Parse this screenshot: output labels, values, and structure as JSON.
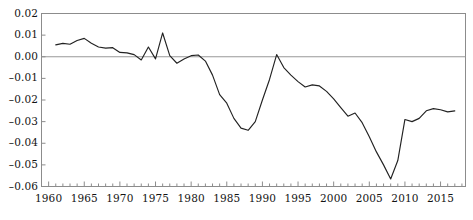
{
  "chart_data": {
    "type": "line",
    "title": "",
    "xlabel": "",
    "ylabel": "",
    "xlim": [
      1959.0,
      2018.5
    ],
    "ylim": [
      -0.06,
      0.02
    ],
    "grid": false,
    "legend": null,
    "zero_line": 0.0,
    "y_ticks": [
      0.02,
      0.01,
      0.0,
      -0.01,
      -0.02,
      -0.03,
      -0.04,
      -0.05,
      -0.06
    ],
    "y_tick_labels": [
      "0.02",
      "0.01",
      "0.00",
      "–0.01",
      "–0.02",
      "–0.03",
      "–0.04",
      "–0.05",
      "–0.06"
    ],
    "x_ticks": [
      1960,
      1965,
      1970,
      1975,
      1980,
      1985,
      1990,
      1995,
      2000,
      2005,
      2010,
      2015
    ],
    "x_tick_labels": [
      "1960",
      "1965",
      "1970",
      "1975",
      "1980",
      "1985",
      "1990",
      "1995",
      "2000",
      "2005",
      "2010",
      "2015"
    ],
    "x_minor_tick_step": 1,
    "line_color": "#222222",
    "axis_color": "#8c8c8c",
    "zero_line_color": "#999999",
    "x": [
      1961,
      1962,
      1963,
      1964,
      1965,
      1966,
      1967,
      1968,
      1969,
      1970,
      1971,
      1972,
      1973,
      1974,
      1975,
      1976,
      1977,
      1978,
      1979,
      1980,
      1981,
      1982,
      1983,
      1984,
      1985,
      1986,
      1987,
      1988,
      1989,
      1990,
      1991,
      1992,
      1993,
      1994,
      1995,
      1996,
      1997,
      1998,
      1999,
      2000,
      2001,
      2002,
      2003,
      2004,
      2005,
      2006,
      2007,
      2008,
      2009,
      2010,
      2011,
      2012,
      2013,
      2014,
      2015,
      2016,
      2017
    ],
    "y": [
      0.0055,
      0.0062,
      0.0058,
      0.0075,
      0.0085,
      0.0062,
      0.0045,
      0.004,
      0.0042,
      0.002,
      0.0018,
      0.001,
      -0.0015,
      0.0045,
      -0.001,
      0.011,
      0.0005,
      -0.003,
      -0.001,
      0.0005,
      0.0008,
      -0.002,
      -0.0085,
      -0.0175,
      -0.0215,
      -0.0285,
      -0.033,
      -0.034,
      -0.03,
      -0.02,
      -0.0105,
      0.001,
      -0.005,
      -0.0085,
      -0.0115,
      -0.014,
      -0.013,
      -0.0135,
      -0.016,
      -0.0195,
      -0.0235,
      -0.0275,
      -0.026,
      -0.0305,
      -0.037,
      -0.044,
      -0.05,
      -0.0565,
      -0.048,
      -0.029,
      -0.03,
      -0.0285,
      -0.025,
      -0.024,
      -0.0245,
      -0.0255,
      -0.025
    ]
  }
}
